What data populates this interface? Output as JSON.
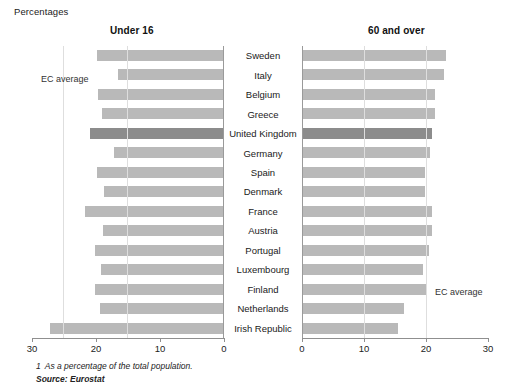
{
  "units_label": "Percentages",
  "panels": {
    "left": {
      "title": "Under 16",
      "ec_average_label": "EC average"
    },
    "right": {
      "title": "60 and over",
      "ec_average_label": "EC average"
    }
  },
  "axis": {
    "left_ticks": [
      "30",
      "20",
      "10",
      "0"
    ],
    "right_ticks": [
      "0",
      "10",
      "20",
      "30"
    ],
    "max": 30
  },
  "footnote": {
    "number": "1",
    "text": "As a percentage of the total population."
  },
  "source": "Source: Eurostat",
  "highlight_country": "United Kingdom",
  "colors": {
    "bar": "#b9b9b9",
    "bar_highlight": "#8c8c8c",
    "axis": "#8f8f8f",
    "grid": "#dedede",
    "text": "#1a1a1a"
  },
  "chart_data": {
    "type": "bar",
    "subtitle": "Percentages",
    "orientation": "horizontal-bidirectional",
    "xlabel": "",
    "ylabel": "",
    "xlim": [
      0,
      30
    ],
    "grid": true,
    "legend": "none",
    "categories": [
      "Sweden",
      "Italy",
      "Belgium",
      "Greece",
      "United Kingdom",
      "Germany",
      "Spain",
      "Denmark",
      "France",
      "Austria",
      "Portugal",
      "Luxembourg",
      "Finland",
      "Netherlands",
      "Irish Republic"
    ],
    "series": [
      {
        "name": "Under 16",
        "direction": "left",
        "values": [
          19.8,
          16.5,
          19.7,
          19.1,
          20.9,
          17.2,
          19.9,
          18.7,
          21.7,
          18.9,
          20.2,
          19.2,
          20.2,
          19.4,
          27.2
        ]
      },
      {
        "name": "60 and over",
        "direction": "right",
        "values": [
          23.2,
          22.9,
          21.4,
          21.4,
          20.9,
          20.7,
          19.8,
          19.8,
          21.0,
          21.0,
          20.5,
          19.5,
          20.0,
          16.5,
          15.5
        ]
      }
    ],
    "annotations": [
      {
        "text": "EC average",
        "panel": "left",
        "row": "Italy"
      },
      {
        "text": "EC average",
        "panel": "right",
        "row": "Finland"
      }
    ],
    "footnote": "1  As a percentage of the total population.",
    "source": "Source: Eurostat"
  }
}
